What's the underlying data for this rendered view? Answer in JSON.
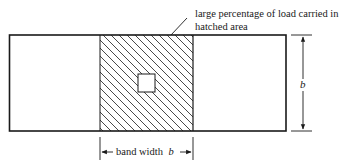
{
  "annotation": {
    "line1": "large percentage of load carried in",
    "line2": "hatched area"
  },
  "dimensions": {
    "band_label": "band width",
    "band_symbol": "b",
    "height_symbol": "b"
  },
  "colors": {
    "stroke": "#1a1a1a",
    "background": "#ffffff"
  }
}
